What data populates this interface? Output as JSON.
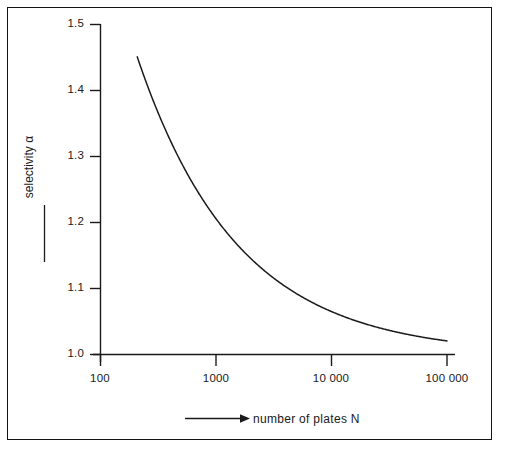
{
  "figure": {
    "border_color": "#141414",
    "background": "#ffffff",
    "axis_color": "#1a1a1a",
    "curve_color": "#1a1a1a"
  },
  "axes": {
    "y_title": "selectivity α",
    "x_title": "number of plates N",
    "x_arrow_glyph": "⟶",
    "y_ticks": [
      "1.5",
      "1.4",
      "1.3",
      "1.2",
      "1.1",
      "1.0"
    ],
    "x_ticks": [
      "100",
      "1000",
      "10 000",
      "100 000"
    ]
  },
  "chart_data": {
    "type": "line",
    "title": "",
    "xlabel": "number of plates N",
    "ylabel": "selectivity α",
    "xscale": "log",
    "yscale": "linear",
    "xlim": [
      100,
      100000
    ],
    "ylim": [
      1.0,
      1.5
    ],
    "xticks": [
      100,
      1000,
      10000,
      100000
    ],
    "xticklabels": [
      "100",
      "1000",
      "10 000",
      "100 000"
    ],
    "yticks": [
      1.0,
      1.1,
      1.2,
      1.3,
      1.4,
      1.5
    ],
    "yticklabels": [
      "1.0",
      "1.1",
      "1.2",
      "1.3",
      "1.4",
      "1.5"
    ],
    "grid": false,
    "legend": null,
    "series": [
      {
        "name": "selectivity required",
        "formula": "alpha = 1 + 6.5 / sqrt(N)",
        "x": [
          208,
          250,
          300,
          400,
          500,
          700,
          1000,
          1500,
          2000,
          3000,
          5000,
          7000,
          10000,
          15000,
          20000,
          30000,
          50000,
          70000,
          100000
        ],
        "y": [
          1.451,
          1.411,
          1.375,
          1.325,
          1.291,
          1.246,
          1.206,
          1.168,
          1.145,
          1.119,
          1.092,
          1.078,
          1.065,
          1.053,
          1.046,
          1.038,
          1.029,
          1.025,
          1.021
        ]
      }
    ]
  }
}
